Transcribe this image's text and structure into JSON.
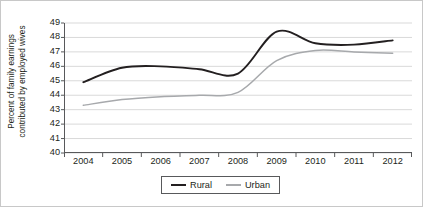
{
  "chart_data": {
    "type": "line",
    "title": "",
    "xlabel": "",
    "ylabel": "Percent of family earnings contributed by employed wives",
    "ylabel_lines": [
      "Percent of family earnings",
      "contributed by employed wives"
    ],
    "categories": [
      2004,
      2005,
      2006,
      2007,
      2008,
      2009,
      2010,
      2011,
      2012
    ],
    "x": [
      2004,
      2005,
      2006,
      2007,
      2008,
      2009,
      2010,
      2011,
      2012
    ],
    "xlim": [
      2003.5,
      2012.5
    ],
    "ylim": [
      40,
      49
    ],
    "y_ticks": [
      40,
      41,
      42,
      43,
      44,
      45,
      46,
      47,
      48,
      49
    ],
    "x_tick_labels": [
      "2004",
      "2005",
      "2006",
      "2007",
      "2008",
      "2009",
      "2010",
      "2011",
      "2012"
    ],
    "grid": true,
    "grid_axis": "y",
    "legend_position": "bottom-center",
    "series": [
      {
        "name": "Rural",
        "color": "#231f20",
        "values": [
          44.9,
          45.9,
          46.0,
          45.8,
          45.5,
          48.4,
          47.6,
          47.5,
          47.8
        ]
      },
      {
        "name": "Urban",
        "color": "#a7a9ac",
        "values": [
          43.3,
          43.7,
          43.9,
          44.0,
          44.2,
          46.4,
          47.1,
          47.0,
          46.9
        ]
      }
    ]
  },
  "legend": {
    "entries": [
      {
        "label": "Rural"
      },
      {
        "label": "Urban"
      }
    ]
  }
}
